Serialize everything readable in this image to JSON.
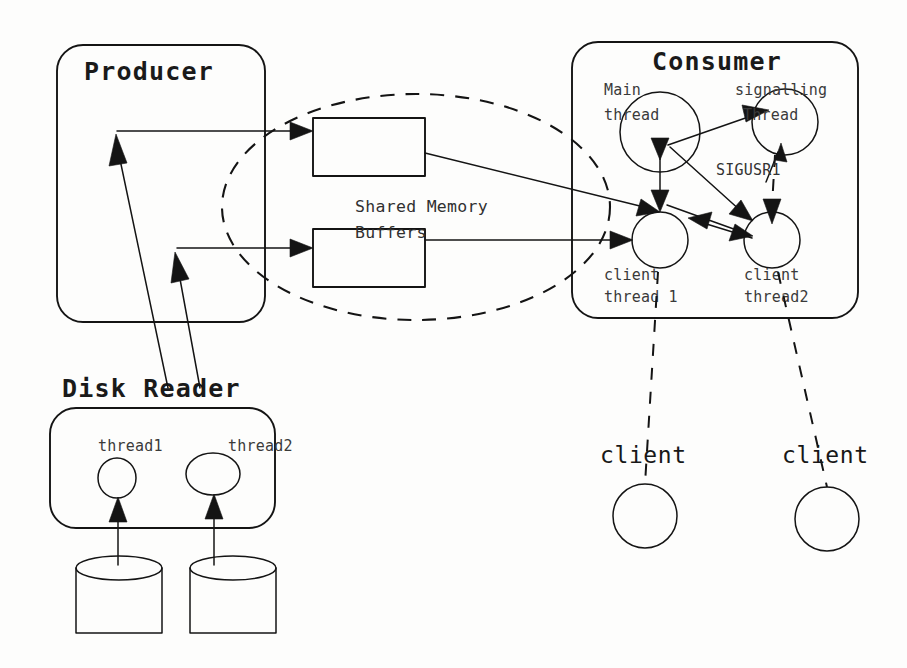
{
  "diagram": {
    "canvas": {
      "width": 907,
      "height": 668,
      "background": "#fdfdfc"
    },
    "ink_color": "#141414"
  },
  "producer": {
    "title": "Producer",
    "box": {
      "x": 57,
      "y": 45,
      "width": 208,
      "height": 277,
      "radius": 26
    }
  },
  "consumer": {
    "title": "Consumer",
    "box": {
      "x": 572,
      "y": 42,
      "width": 286,
      "height": 276,
      "radius": 26
    },
    "threads": [
      {
        "name": "main-thread",
        "label_line1": "Main",
        "label_line2": "thread",
        "cx": 660,
        "cy": 132,
        "r": 40
      },
      {
        "name": "signalling-thread",
        "label_line1": "signalling",
        "label_line2": "Thread",
        "cx": 785,
        "cy": 122,
        "r": 33
      },
      {
        "name": "client-thread-1",
        "label_line1": "client",
        "label_line2": "thread 1",
        "cx": 660,
        "cy": 240,
        "r": 28
      },
      {
        "name": "client-thread-2",
        "label_line1": "client",
        "label_line2": "thread2",
        "cx": 772,
        "cy": 240,
        "r": 28
      }
    ],
    "signal_label": "SIGUSR1"
  },
  "shared_memory": {
    "label_line1": "Shared Memory",
    "label_line2": "Buffers",
    "buffers": [
      {
        "name": "buffer-top",
        "x": 313,
        "y": 118,
        "width": 112,
        "height": 58
      },
      {
        "name": "buffer-bottom",
        "x": 313,
        "y": 229,
        "width": 112,
        "height": 58
      }
    ],
    "boundary": {
      "cx": 416,
      "cy": 207,
      "rx": 194,
      "ry": 113
    }
  },
  "disk_reader": {
    "title": "Disk Reader",
    "box": {
      "x": 50,
      "y": 408,
      "width": 225,
      "height": 120,
      "radius": 26
    },
    "threads": [
      {
        "name": "disk-thread-1",
        "label": "thread1",
        "cx": 117,
        "cy": 478,
        "rx": 19,
        "ry": 20
      },
      {
        "name": "disk-thread-2",
        "label": "thread2",
        "cx": 213,
        "cy": 474,
        "rx": 27,
        "ry": 21
      }
    ],
    "disks": [
      {
        "name": "disk-1",
        "x": 76,
        "y": 568,
        "width": 86,
        "height": 65,
        "ellipse_ry": 12
      },
      {
        "name": "disk-2",
        "x": 190,
        "y": 568,
        "width": 86,
        "height": 65,
        "ellipse_ry": 12
      }
    ]
  },
  "clients": [
    {
      "name": "client-1",
      "label": "client",
      "label_x": 600,
      "label_y": 463,
      "cx": 645,
      "cy": 516,
      "r": 32
    },
    {
      "name": "client-2",
      "label": "client",
      "label_x": 782,
      "label_y": 463,
      "cx": 827,
      "cy": 519,
      "r": 32
    }
  ],
  "legend": {
    "flow_description": "Disk reader threads feed the Producer which writes into shared memory buffers consumed by the Consumer client threads."
  }
}
